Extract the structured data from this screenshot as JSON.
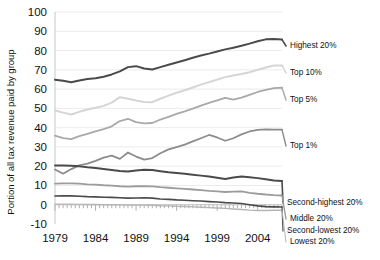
{
  "chart_data": {
    "type": "line",
    "title": "",
    "xlabel": "",
    "ylabel": "Portion of all tax revenue paid by group",
    "xlim": [
      1979,
      2007
    ],
    "ylim": [
      -10,
      100
    ],
    "ytick_step": 10,
    "grid": true,
    "legend_position": "right-inline-labels",
    "yticks": [
      "100",
      "90",
      "80",
      "70",
      "60",
      "50",
      "40",
      "30",
      "20",
      "10",
      "0",
      "-10"
    ],
    "xticks": [
      "1979",
      "1984",
      "1989",
      "1994",
      "1999",
      "2004"
    ],
    "x": [
      1979,
      1980,
      1981,
      1982,
      1983,
      1984,
      1985,
      1986,
      1987,
      1988,
      1989,
      1990,
      1991,
      1992,
      1993,
      1994,
      1995,
      1996,
      1997,
      1998,
      1999,
      2000,
      2001,
      2002,
      2003,
      2004,
      2005,
      2006,
      2007
    ],
    "series": [
      {
        "name": "Highest 20%",
        "color": "#4a4a4a",
        "width": 2.0,
        "values": [
          64.9,
          64.3,
          63.6,
          64.5,
          65.2,
          65.6,
          66.4,
          67.6,
          69.2,
          71.4,
          71.9,
          70.7,
          70.2,
          71.4,
          72.6,
          73.8,
          75.0,
          76.3,
          77.4,
          78.4,
          79.5,
          80.6,
          81.5,
          82.5,
          83.6,
          84.8,
          85.8,
          86.0,
          85.7
        ]
      },
      {
        "name": "Top 10%",
        "color": "#d5d5d5",
        "width": 2.0,
        "values": [
          48.9,
          47.8,
          46.8,
          48.2,
          49.4,
          50.3,
          51.3,
          53.0,
          55.8,
          55.0,
          54.1,
          53.3,
          53.2,
          55.0,
          56.6,
          58.1,
          59.4,
          60.8,
          62.3,
          63.6,
          64.9,
          66.2,
          67.0,
          67.8,
          68.7,
          70.0,
          71.2,
          72.2,
          72.3
        ]
      },
      {
        "name": "Top 5%",
        "color": "#a9a9a9",
        "width": 1.8,
        "values": [
          35.8,
          34.6,
          34.0,
          35.6,
          36.8,
          38.0,
          39.2,
          40.7,
          43.4,
          44.6,
          42.9,
          42.2,
          42.4,
          44.2,
          45.6,
          47.1,
          48.4,
          49.9,
          51.4,
          52.8,
          54.1,
          55.4,
          54.5,
          55.6,
          57.0,
          58.5,
          59.6,
          60.5,
          60.7
        ]
      },
      {
        "name": "Top 1%",
        "color": "#8c8c8c",
        "width": 1.8,
        "values": [
          18.3,
          16.1,
          18.5,
          20.4,
          21.3,
          22.8,
          24.4,
          25.5,
          23.8,
          27.1,
          25.0,
          23.4,
          24.2,
          26.7,
          28.7,
          29.9,
          31.2,
          32.9,
          34.5,
          36.2,
          34.9,
          33.2,
          34.5,
          36.5,
          38.0,
          38.8,
          39.1,
          39.0,
          39.0
        ]
      },
      {
        "name": "Second-highest 20%",
        "color": "#4a4a4a",
        "width": 2.0,
        "values": [
          20.4,
          20.4,
          20.2,
          19.9,
          19.4,
          19.0,
          18.5,
          18.0,
          17.5,
          17.3,
          17.8,
          18.1,
          18.0,
          17.4,
          16.9,
          16.5,
          16.1,
          15.6,
          15.1,
          14.6,
          14.0,
          13.4,
          14.1,
          14.7,
          14.3,
          13.8,
          13.2,
          12.6,
          12.3
        ]
      },
      {
        "name": "Middle 20%",
        "color": "#9c9c9c",
        "width": 1.8,
        "values": [
          11.0,
          11.1,
          11.1,
          10.9,
          10.6,
          10.4,
          10.1,
          9.9,
          9.6,
          9.4,
          9.6,
          9.7,
          9.5,
          9.1,
          8.8,
          8.5,
          8.2,
          7.9,
          7.6,
          7.2,
          6.9,
          6.6,
          6.8,
          6.9,
          6.2,
          5.7,
          5.3,
          5.0,
          4.8
        ]
      },
      {
        "name": "Second-lowest 20%",
        "color": "#4a4a4a",
        "width": 1.6,
        "values": [
          4.5,
          4.6,
          4.6,
          4.4,
          4.2,
          4.1,
          3.9,
          3.8,
          3.6,
          3.4,
          3.5,
          3.6,
          3.4,
          3.0,
          2.8,
          2.5,
          2.3,
          2.1,
          1.9,
          1.6,
          1.4,
          1.1,
          0.9,
          0.6,
          0.0,
          -0.6,
          -1.0,
          -1.1,
          -1.2
        ]
      },
      {
        "name": "Lowest 20%",
        "color": "#b5b5b5",
        "width": 1.4,
        "values": [
          0.3,
          0.3,
          0.3,
          0.2,
          0.1,
          0.1,
          0.0,
          0.0,
          -0.1,
          -0.2,
          -0.2,
          -0.2,
          -0.3,
          -0.5,
          -0.6,
          -0.8,
          -0.9,
          -1.1,
          -1.3,
          -1.5,
          -1.7,
          -1.9,
          -2.2,
          -2.5,
          -2.8,
          -3.0,
          -3.0,
          -2.9,
          -2.9
        ]
      }
    ],
    "series_labels": [
      {
        "text": "Highest 20%",
        "x": 290,
        "y": 46
      },
      {
        "text": "Top 10%",
        "x": 290,
        "y": 73
      },
      {
        "text": "Top 5%",
        "x": 290,
        "y": 100
      },
      {
        "text": "Top 1%",
        "x": 290,
        "y": 146
      },
      {
        "text": "Second-highest 20%",
        "x": 287,
        "y": 203
      },
      {
        "text": "Middle 20%",
        "x": 290,
        "y": 219
      },
      {
        "text": "Second-lowest 20%",
        "x": 287,
        "y": 231
      },
      {
        "text": "Lowest 20%",
        "x": 290,
        "y": 242
      }
    ]
  }
}
